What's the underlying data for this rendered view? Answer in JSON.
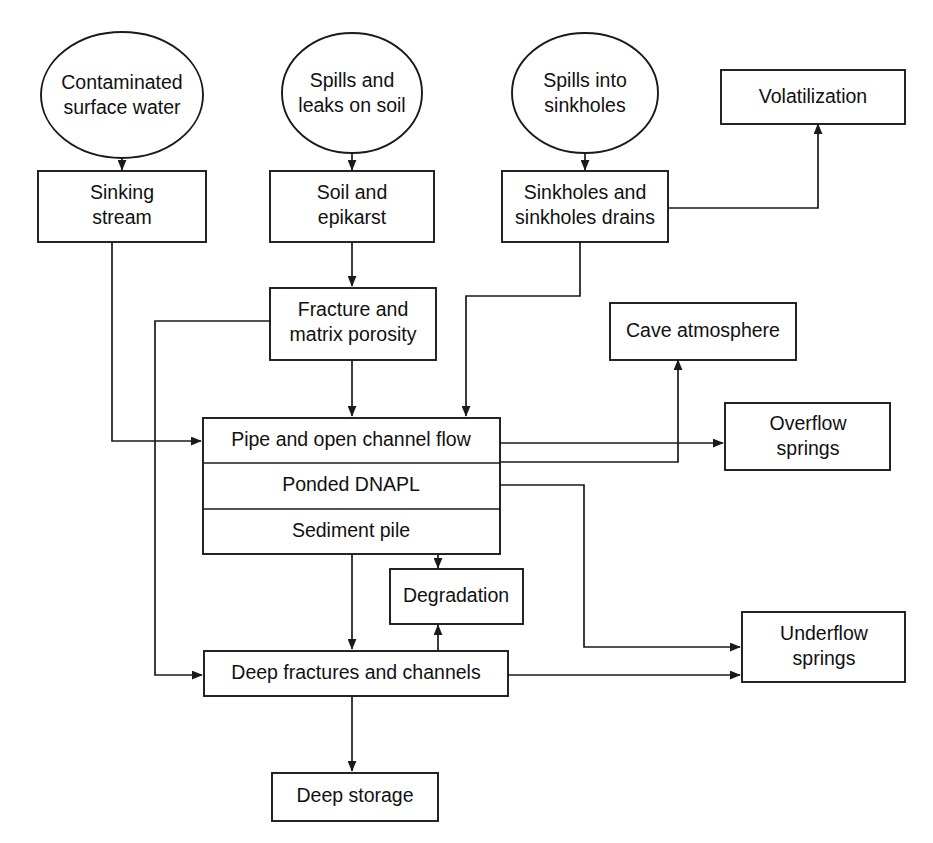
{
  "diagram": {
    "stroke_color": "#1a1a1a",
    "background_color": "#ffffff",
    "nodes": {
      "contaminated_surface_water": {
        "line1": "Contaminated",
        "line2": "surface water",
        "shape": "ellipse"
      },
      "spills_leaks_soil": {
        "line1": "Spills and",
        "line2": "leaks on soil",
        "shape": "ellipse"
      },
      "spills_into_sinkholes": {
        "line1": "Spills into",
        "line2": "sinkholes",
        "shape": "ellipse"
      },
      "sinking_stream": {
        "line1": "Sinking",
        "line2": "stream",
        "shape": "rect"
      },
      "soil_and_epikarst": {
        "line1": "Soil and",
        "line2": "epikarst",
        "shape": "rect"
      },
      "sinkholes_and_drains": {
        "line1": "Sinkholes and",
        "line2": "sinkholes drains",
        "shape": "rect"
      },
      "volatilization": {
        "line1": "Volatilization",
        "shape": "rect"
      },
      "fracture_matrix_porosity": {
        "line1": "Fracture and",
        "line2": "matrix porosity",
        "shape": "rect"
      },
      "cave_atmosphere": {
        "line1": "Cave atmosphere",
        "shape": "rect"
      },
      "pipe_open_channel_flow": {
        "line1": "Pipe and open channel flow",
        "shape": "rect-stacked-top"
      },
      "ponded_dnapl": {
        "line1": "Ponded DNAPL",
        "shape": "rect-stacked-middle"
      },
      "sediment_pile": {
        "line1": "Sediment pile",
        "shape": "rect-stacked-bottom"
      },
      "overflow_springs": {
        "line1": "Overflow",
        "line2": "springs",
        "shape": "rect"
      },
      "degradation": {
        "line1": "Degradation",
        "shape": "rect"
      },
      "deep_fractures_channels": {
        "line1": "Deep fractures and channels",
        "shape": "rect"
      },
      "underflow_springs": {
        "line1": "Underflow",
        "line2": "springs",
        "shape": "rect"
      },
      "deep_storage": {
        "line1": "Deep storage",
        "shape": "rect"
      }
    },
    "edges": [
      {
        "from": "contaminated_surface_water",
        "to": "sinking_stream",
        "arrow": true
      },
      {
        "from": "spills_leaks_soil",
        "to": "soil_and_epikarst",
        "arrow": true
      },
      {
        "from": "spills_into_sinkholes",
        "to": "sinkholes_and_drains",
        "arrow": true
      },
      {
        "from": "soil_and_epikarst",
        "to": "fracture_matrix_porosity",
        "arrow": true
      },
      {
        "from": "sinking_stream",
        "to": "pipe_open_channel_flow",
        "arrow": true
      },
      {
        "from": "fracture_matrix_porosity",
        "to": "pipe_open_channel_flow",
        "arrow": true
      },
      {
        "from": "fracture_matrix_porosity",
        "to": "deep_fractures_channels",
        "arrow": true
      },
      {
        "from": "sinkholes_and_drains",
        "to": "pipe_open_channel_flow",
        "arrow": true
      },
      {
        "from": "sinkholes_and_drains",
        "to": "volatilization",
        "arrow": true
      },
      {
        "from": "cave_atmosphere",
        "to": "volatilization",
        "arrow": true
      },
      {
        "from": "pipe_open_channel_flow",
        "to": "overflow_springs",
        "arrow": true
      },
      {
        "from": "pipe_open_channel_flow",
        "to": "cave_atmosphere",
        "arrow": true
      },
      {
        "from": "ponded_dnapl",
        "to": "underflow_springs",
        "arrow": true
      },
      {
        "from": "sediment_pile",
        "to": "deep_fractures_channels",
        "arrow": true
      },
      {
        "from": "sediment_pile",
        "to": "degradation",
        "arrow": true
      },
      {
        "from": "deep_fractures_channels",
        "to": "degradation",
        "arrow": true
      },
      {
        "from": "deep_fractures_channels",
        "to": "underflow_springs",
        "arrow": true
      },
      {
        "from": "deep_fractures_channels",
        "to": "deep_storage",
        "arrow": true
      }
    ]
  }
}
